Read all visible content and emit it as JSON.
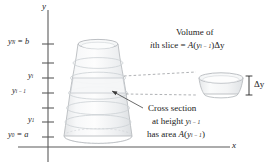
{
  "figure": {
    "kind": "calculus-volume-by-slicing-diagram",
    "axes": {
      "y_axis_label": "y",
      "x_axis_label": "x"
    },
    "y_ticks": [
      {
        "id": "yN",
        "label_main": "y",
        "label_sub": "N",
        "label_tail": " = b",
        "value_name": "b"
      },
      {
        "id": "yi",
        "label_main": "y",
        "label_sub": "i",
        "label_tail": "",
        "value_name": "y_i"
      },
      {
        "id": "yim1",
        "label_main": "y",
        "label_sub": "i − 1",
        "label_tail": "",
        "value_name": "y_{i-1}"
      },
      {
        "id": "y1",
        "label_main": "y",
        "label_sub": "1",
        "label_tail": "",
        "value_name": "y_1"
      },
      {
        "id": "y0",
        "label_main": "y",
        "label_sub": "0",
        "label_tail": " = a",
        "value_name": "a"
      }
    ],
    "annotations": {
      "volume_line1": "Volume of",
      "volume_line2_pre": "i",
      "volume_line2_mid": "th slice = ",
      "volume_line2_fn": "A",
      "volume_line2_arg_open": "(",
      "volume_line2_arg_var": "y",
      "volume_line2_arg_sub": "i − 1",
      "volume_line2_arg_close": ")",
      "volume_line2_dy": "Δy",
      "cross_line1": "Cross section",
      "cross_line2_pre": "at height ",
      "cross_line2_var": "y",
      "cross_line2_sub": "i − 1",
      "cross_line3_pre": "has area ",
      "cross_line3_fn": "A",
      "cross_line3_open": "(",
      "cross_line3_var": "y",
      "cross_line3_sub": "i − 1",
      "cross_line3_close": ")",
      "delta_y": "Δy"
    },
    "colors": {
      "axis": "#5b5b5b",
      "ink": "#1a1a1a",
      "solid_outline": "#b9bcc0",
      "solid_fill": "#f2f3f4",
      "band_line": "#ccd0d4",
      "leader": "#8c8f93"
    }
  }
}
